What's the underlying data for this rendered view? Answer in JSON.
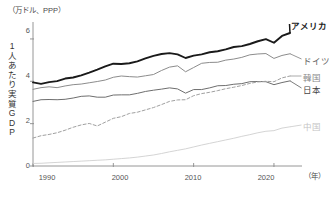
{
  "axes": {
    "unit_label": "（万ドル、PPP）",
    "y_title_chars": [
      "1",
      "人",
      "あ",
      "た",
      "り",
      "実",
      "質",
      "G",
      "D",
      "P"
    ],
    "y_title_text": "1人あたり実質GDP",
    "x_title": "（年）",
    "y_ticks": [
      "0",
      "2",
      "4",
      "6"
    ],
    "x_ticks": [
      "1990",
      "2000",
      "2010",
      "2020"
    ]
  },
  "series_labels": {
    "america": "アメリカ",
    "germany": "ドイツ",
    "korea": "韓国",
    "japan": "日本",
    "china": "中国"
  },
  "colors": {
    "america": "#1a1a1a",
    "germany": "#8c8c8c",
    "korea": "#a0a0a0",
    "japan": "#6e6e6e",
    "china": "#cfcfcf",
    "axis": "#8a8a8a",
    "text": "#4a4a4a"
  },
  "chart_data": {
    "type": "line",
    "title": "",
    "subtitle": "",
    "xlabel": "（年）",
    "ylabel": "1人あたり実質GDP",
    "unit": "万ドル、PPP",
    "xlim": [
      1990,
      2022
    ],
    "ylim": [
      0,
      6.8
    ],
    "yticks": [
      0,
      2,
      4,
      6
    ],
    "xticks": [
      1990,
      2000,
      2010,
      2020
    ],
    "grid": false,
    "legend_position": "right-inline",
    "x": [
      1990,
      1991,
      1992,
      1993,
      1994,
      1995,
      1996,
      1997,
      1998,
      1999,
      2000,
      2001,
      2002,
      2003,
      2004,
      2005,
      2006,
      2007,
      2008,
      2009,
      2010,
      2011,
      2012,
      2013,
      2014,
      2015,
      2016,
      2017,
      2018,
      2019,
      2020,
      2021,
      2022
    ],
    "series": [
      {
        "name": "アメリカ",
        "name_en": "United States",
        "style": "solid-thick",
        "color": "#1a1a1a",
        "values": [
          3.95,
          3.88,
          3.96,
          4.01,
          4.13,
          4.18,
          4.28,
          4.41,
          4.55,
          4.7,
          4.83,
          4.82,
          4.85,
          4.94,
          5.08,
          5.2,
          5.29,
          5.33,
          5.27,
          5.1,
          5.21,
          5.27,
          5.37,
          5.42,
          5.51,
          5.62,
          5.66,
          5.76,
          5.89,
          5.99,
          5.82,
          6.14,
          6.28
        ]
      },
      {
        "name": "ドイツ",
        "name_en": "Germany",
        "style": "solid",
        "color": "#8c8c8c",
        "values": [
          3.62,
          3.7,
          3.74,
          3.7,
          3.78,
          3.84,
          3.87,
          3.93,
          3.99,
          4.06,
          4.19,
          4.25,
          4.22,
          4.2,
          4.26,
          4.32,
          4.51,
          4.67,
          4.73,
          4.45,
          4.65,
          4.85,
          4.89,
          4.9,
          5.0,
          5.05,
          5.13,
          5.25,
          5.29,
          5.31,
          5.08,
          5.22,
          5.3
        ]
      },
      {
        "name": "日本",
        "name_en": "Japan",
        "style": "solid",
        "color": "#6e6e6e",
        "values": [
          3.05,
          3.13,
          3.14,
          3.13,
          3.15,
          3.21,
          3.29,
          3.31,
          3.25,
          3.25,
          3.35,
          3.36,
          3.36,
          3.43,
          3.52,
          3.58,
          3.63,
          3.69,
          3.64,
          3.44,
          3.61,
          3.61,
          3.69,
          3.79,
          3.8,
          3.86,
          3.89,
          3.98,
          3.99,
          3.98,
          3.84,
          3.94,
          4.02
        ]
      },
      {
        "name": "韓国",
        "name_en": "South Korea",
        "style": "dashed",
        "color": "#a0a0a0",
        "values": [
          1.32,
          1.43,
          1.49,
          1.57,
          1.69,
          1.83,
          1.94,
          2.01,
          1.89,
          2.07,
          2.25,
          2.33,
          2.48,
          2.54,
          2.65,
          2.76,
          2.9,
          3.05,
          3.12,
          3.13,
          3.32,
          3.42,
          3.48,
          3.56,
          3.65,
          3.72,
          3.8,
          3.9,
          3.97,
          4.0,
          3.98,
          4.16,
          4.25
        ]
      },
      {
        "name": "中国",
        "name_en": "China",
        "style": "solid-light",
        "color": "#cfcfcf",
        "values": [
          0.12,
          0.13,
          0.15,
          0.17,
          0.19,
          0.21,
          0.23,
          0.25,
          0.27,
          0.29,
          0.32,
          0.35,
          0.38,
          0.42,
          0.47,
          0.52,
          0.59,
          0.67,
          0.74,
          0.81,
          0.9,
          0.99,
          1.07,
          1.15,
          1.23,
          1.31,
          1.4,
          1.48,
          1.57,
          1.64,
          1.67,
          1.79,
          1.85
        ]
      }
    ]
  },
  "label_positions": {
    "america": {
      "left": 291,
      "top": 19
    },
    "germany": {
      "left": 303,
      "top": 54
    },
    "korea": {
      "left": 303,
      "top": 71
    },
    "japan": {
      "left": 303,
      "top": 83
    },
    "china": {
      "left": 303,
      "top": 120
    }
  }
}
